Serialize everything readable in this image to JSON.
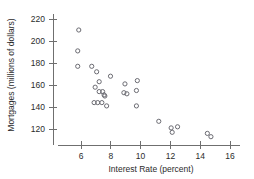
{
  "chart_data": {
    "type": "scatter",
    "title": "",
    "xlabel": "Interest Rate (percent)",
    "ylabel": "Mortgages (millions of dollars)",
    "xlim": [
      5,
      16.6
    ],
    "ylim": [
      110,
      224
    ],
    "xticks": [
      6,
      8,
      10,
      12,
      14,
      16
    ],
    "yticks": [
      120,
      140,
      160,
      180,
      200,
      220
    ],
    "xtick_labels": [
      "6",
      "8",
      "10",
      "12",
      "14",
      "16"
    ],
    "ytick_labels": [
      "120",
      "140",
      "160",
      "180",
      "200",
      "220"
    ],
    "grid": false,
    "legend": null,
    "marker": "open-circle",
    "marker_color": "#6b6b72",
    "points": [
      {
        "x": 5.85,
        "y": 210
      },
      {
        "x": 5.78,
        "y": 191
      },
      {
        "x": 5.78,
        "y": 177
      },
      {
        "x": 6.72,
        "y": 177
      },
      {
        "x": 7.05,
        "y": 172
      },
      {
        "x": 7.22,
        "y": 163
      },
      {
        "x": 6.95,
        "y": 158
      },
      {
        "x": 7.22,
        "y": 154
      },
      {
        "x": 7.45,
        "y": 154
      },
      {
        "x": 7.55,
        "y": 151
      },
      {
        "x": 7.6,
        "y": 150
      },
      {
        "x": 6.88,
        "y": 144
      },
      {
        "x": 7.12,
        "y": 144
      },
      {
        "x": 7.4,
        "y": 144
      },
      {
        "x": 7.72,
        "y": 141
      },
      {
        "x": 7.98,
        "y": 168
      },
      {
        "x": 8.95,
        "y": 161
      },
      {
        "x": 8.88,
        "y": 153
      },
      {
        "x": 9.08,
        "y": 152
      },
      {
        "x": 9.78,
        "y": 164
      },
      {
        "x": 9.72,
        "y": 155
      },
      {
        "x": 9.72,
        "y": 141
      },
      {
        "x": 11.22,
        "y": 127
      },
      {
        "x": 12.05,
        "y": 121
      },
      {
        "x": 12.12,
        "y": 117
      },
      {
        "x": 12.48,
        "y": 122
      },
      {
        "x": 14.48,
        "y": 116
      },
      {
        "x": 14.72,
        "y": 113
      }
    ]
  },
  "axes": {
    "x_axis_name": "interest-rate-axis",
    "y_axis_name": "mortgages-axis"
  }
}
